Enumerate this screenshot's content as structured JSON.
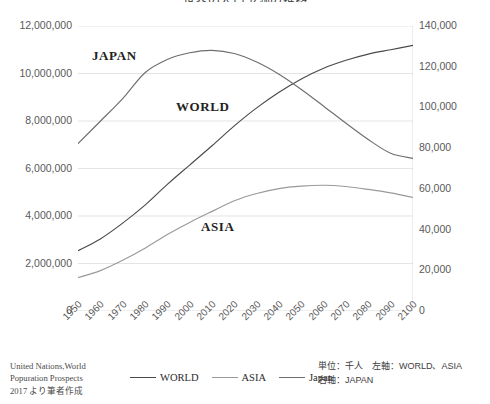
{
  "chart_data": {
    "type": "line",
    "title": "世界の人口予測の推移",
    "xlabel": "",
    "ylabel": "",
    "grid": true,
    "legend_position": "bottom",
    "x": [
      "1950",
      "1960",
      "1970",
      "1980",
      "1990",
      "2000",
      "2010",
      "2020",
      "2030",
      "2040",
      "2050",
      "2060",
      "2070",
      "2080",
      "2090",
      "2100"
    ],
    "axes": {
      "left": {
        "label": "WORLD, ASIA",
        "ticks": [
          "0",
          "2,000,000",
          "4,000,000",
          "6,000,000",
          "8,000,000",
          "10,000,000",
          "12,000,000"
        ],
        "min": 0,
        "max": 12000000,
        "step": 2000000,
        "unit": "千人"
      },
      "right": {
        "label": "JAPAN",
        "ticks": [
          "0",
          "20,000",
          "40,000",
          "60,000",
          "80,000",
          "100,000",
          "120,000",
          "140,000"
        ],
        "min": 0,
        "max": 140000,
        "step": 20000,
        "unit": "千人"
      }
    },
    "series": [
      {
        "name": "WORLD",
        "axis": "left",
        "color": "#4a4a4a",
        "values": [
          2536000,
          3035000,
          3700000,
          4458000,
          5331000,
          6145000,
          6958000,
          7795000,
          8551000,
          9210000,
          9772000,
          10222000,
          10557000,
          10818000,
          11000000,
          11184000
        ]
      },
      {
        "name": "ASIA",
        "axis": "left",
        "color": "#9a9a9a",
        "values": [
          1404000,
          1700000,
          2135000,
          2642000,
          3221000,
          3730000,
          4194000,
          4641000,
          4947000,
          5154000,
          5257000,
          5293000,
          5240000,
          5120000,
          4973000,
          4780000
        ]
      },
      {
        "name": "Japan",
        "axis": "right",
        "color": "#6e6e6e",
        "values": [
          82199,
          93216,
          104345,
          117060,
          123537,
          126843,
          128057,
          126476,
          122273,
          116274,
          108794,
          100594,
          92194,
          84200,
          77500,
          74959
        ]
      }
    ],
    "annotations": [
      {
        "text": "JAPAN",
        "series": "Japan"
      },
      {
        "text": "WORLD",
        "series": "WORLD"
      },
      {
        "text": "ASIA",
        "series": "ASIA"
      }
    ]
  },
  "legend": {
    "items": [
      {
        "label": "WORLD",
        "color": "#4a4a4a"
      },
      {
        "label": "ASIA",
        "color": "#9a9a9a"
      },
      {
        "label": "Japan",
        "color": "#6e6e6e"
      }
    ]
  },
  "source_note": {
    "line1": "United Nations,World",
    "line2": "Popuration Prospects",
    "line3": "2017 より筆者作成"
  },
  "unit_note": {
    "line1": "単位：千人　左軸：WORLD、ASIA",
    "line2": "右軸：JAPAN"
  }
}
